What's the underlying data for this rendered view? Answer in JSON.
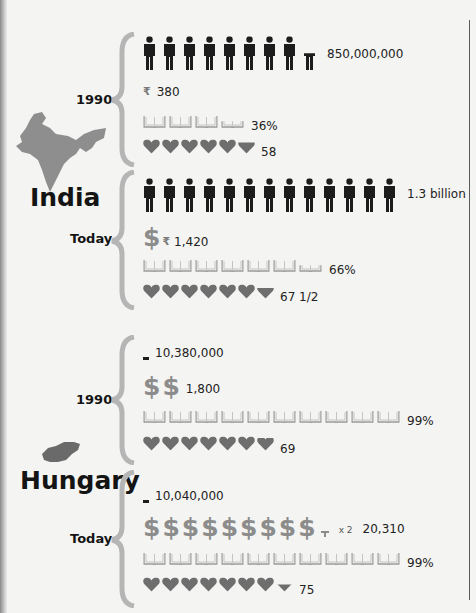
{
  "chart_data": {
    "type": "table",
    "title": "",
    "metrics": [
      "population",
      "income_per_capita",
      "literacy_rate",
      "life_expectancy"
    ],
    "countries": [
      {
        "name": "India",
        "periods": [
          {
            "label": "1990",
            "population": "850,000,000",
            "population_icons": 8.5,
            "income": "380",
            "income_icons": 0.4,
            "literacy": "36%",
            "literacy_books": 3.6,
            "life_expectancy": "58",
            "life_hearts": 5.8
          },
          {
            "label": "Today",
            "population": "1.3 billion",
            "population_icons": 13,
            "income": "1,420",
            "income_icons": 1.4,
            "literacy": "66%",
            "literacy_books": 6.6,
            "life_expectancy": "67 1/2",
            "life_hearts": 6.75
          }
        ]
      },
      {
        "name": "Hungary",
        "periods": [
          {
            "label": "1990",
            "population": "10,380,000",
            "population_icons": 0.1,
            "income": "1,800",
            "income_icons": 1.8,
            "literacy": "99%",
            "literacy_books": 9.9,
            "life_expectancy": "69",
            "life_hearts": 6.9
          },
          {
            "label": "Today",
            "population": "10,040,000",
            "population_icons": 0.1,
            "income": "20,310",
            "income_icons": 20.3,
            "income_multiplier": "x 2",
            "literacy": "99%",
            "literacy_books": 9.9,
            "life_expectancy": "75",
            "life_hearts": 7.5
          }
        ]
      }
    ]
  },
  "colors": {
    "person": "#1c1c1c",
    "heart": "#6e6e6e",
    "book": "#9a9a9a",
    "dollar": "#8c8c8c",
    "map": "#8e8e8e",
    "brace": "#b5b5b5"
  },
  "icons": {
    "person": "person-icon",
    "dollar": "dollar-icon",
    "book": "book-icon",
    "heart": "heart-icon"
  }
}
